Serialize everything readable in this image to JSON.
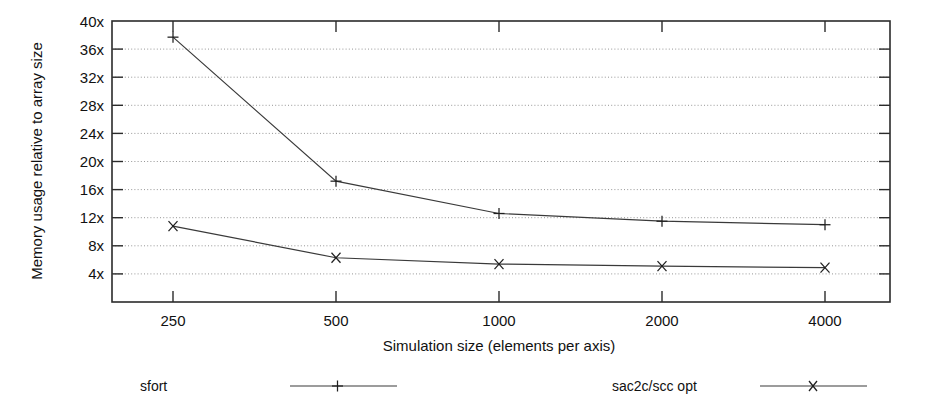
{
  "chart_data": {
    "type": "line",
    "title": "",
    "xlabel": "Simulation size (elements per axis)",
    "ylabel": "Memory usage relative to array size",
    "categories": [
      "250",
      "500",
      "1000",
      "2000",
      "4000"
    ],
    "x_tick_labels": [
      "250",
      "500",
      "1000",
      "2000",
      "4000"
    ],
    "y_tick_labels": [
      "4x",
      "8x",
      "12x",
      "16x",
      "20x",
      "24x",
      "28x",
      "32x",
      "36x",
      "40x"
    ],
    "y_tick_values": [
      4,
      8,
      12,
      16,
      20,
      24,
      28,
      32,
      36,
      40
    ],
    "ylim": [
      0,
      40
    ],
    "grid": true,
    "grid_axis": "y",
    "legend_position": "below",
    "series": [
      {
        "name": "sfort",
        "marker": "plus",
        "values": [
          37.7,
          17.2,
          12.6,
          11.5,
          11.0
        ]
      },
      {
        "name": "sac2c/scc opt",
        "marker": "cross",
        "values": [
          10.8,
          6.3,
          5.4,
          5.1,
          4.9
        ]
      }
    ]
  },
  "legend": {
    "entries": [
      {
        "label": "sfort",
        "marker": "plus"
      },
      {
        "label": "sac2c/scc opt",
        "marker": "cross"
      }
    ]
  },
  "colors": {
    "line": "#3a3a3a",
    "axis": "#2b2b2b",
    "grid": "#8a8a8a",
    "text": "#111111",
    "background": "#ffffff"
  }
}
